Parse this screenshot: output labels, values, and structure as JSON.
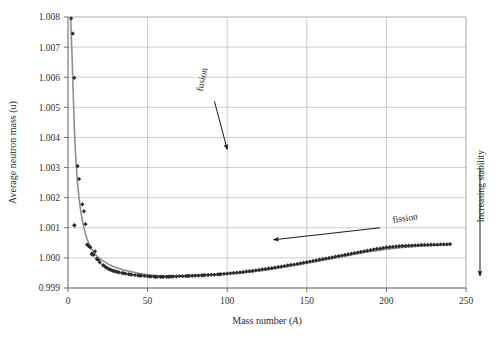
{
  "chart_data": {
    "type": "scatter",
    "title": "",
    "xlabel": "Mass number (A)",
    "xlabel_plain": "Mass number (",
    "xlabel_italic": "A",
    "xlabel_tail": ")",
    "ylabel": "Average neutron mass (u)",
    "xlim": [
      0,
      250
    ],
    "ylim": [
      0.999,
      1.008
    ],
    "xticks": [
      0,
      50,
      100,
      150,
      200,
      250
    ],
    "yticks": [
      0.999,
      1.0,
      1.001,
      1.002,
      1.003,
      1.004,
      1.005,
      1.006,
      1.007,
      1.008
    ],
    "xtick_labels": [
      "0",
      "50",
      "100",
      "150",
      "200",
      "250"
    ],
    "ytick_labels": [
      "0.999",
      "1.000",
      "1.001",
      "1.002",
      "1.003",
      "1.004",
      "1.005",
      "1.006",
      "1.007",
      "1.008"
    ],
    "grid": true,
    "grid_color": "#b9b9b9",
    "legend": "none",
    "marker": "diamond",
    "marker_color": "#2a2a2a",
    "line_color": "#8e8e8e",
    "series": [
      {
        "name": "Average neutron mass per nucleon",
        "points": [
          [
            2,
            1.00795
          ],
          [
            3,
            1.00745
          ],
          [
            4,
            1.00598
          ],
          [
            6,
            1.00305
          ],
          [
            7,
            1.00262
          ],
          [
            9,
            1.00178
          ],
          [
            10,
            1.00155
          ],
          [
            11,
            1.00112
          ],
          [
            12,
            1.00044
          ],
          [
            13,
            1.00039
          ],
          [
            14,
            1.00035
          ],
          [
            15,
            1.00014
          ],
          [
            16,
            1.0001
          ],
          [
            17,
            1.00022
          ],
          [
            18,
            0.99997
          ],
          [
            19,
            0.99993
          ],
          [
            20,
            0.99985
          ],
          [
            22,
            0.99976
          ],
          [
            23,
            0.99972
          ],
          [
            24,
            0.99968
          ],
          [
            25,
            0.99965
          ],
          [
            26,
            0.99962
          ],
          [
            27,
            0.9996
          ],
          [
            28,
            0.99958
          ],
          [
            29,
            0.99956
          ],
          [
            30,
            0.99955
          ],
          [
            31,
            0.99953
          ],
          [
            32,
            0.99952
          ],
          [
            34,
            0.9995
          ],
          [
            35,
            0.99949
          ],
          [
            36,
            0.99948
          ],
          [
            38,
            0.99946
          ],
          [
            39,
            0.99945
          ],
          [
            40,
            0.99944
          ],
          [
            42,
            0.99943
          ],
          [
            44,
            0.99942
          ],
          [
            45,
            0.99941
          ],
          [
            46,
            0.99941
          ],
          [
            48,
            0.9994
          ],
          [
            50,
            0.99939
          ],
          [
            51,
            0.99939
          ],
          [
            52,
            0.99938
          ],
          [
            54,
            0.99938
          ],
          [
            55,
            0.99937
          ],
          [
            56,
            0.99937
          ],
          [
            58,
            0.99937
          ],
          [
            59,
            0.99937
          ],
          [
            60,
            0.99937
          ],
          [
            62,
            0.99937
          ],
          [
            63,
            0.99937
          ],
          [
            64,
            0.99938
          ],
          [
            65,
            0.99938
          ],
          [
            66,
            0.99938
          ],
          [
            68,
            0.99938
          ],
          [
            70,
            0.99939
          ],
          [
            72,
            0.99939
          ],
          [
            74,
            0.99939
          ],
          [
            75,
            0.9994
          ],
          [
            76,
            0.9994
          ],
          [
            78,
            0.9994
          ],
          [
            80,
            0.99941
          ],
          [
            82,
            0.99941
          ],
          [
            84,
            0.99942
          ],
          [
            85,
            0.99942
          ],
          [
            86,
            0.99943
          ],
          [
            88,
            0.99943
          ],
          [
            90,
            0.99944
          ],
          [
            92,
            0.99944
          ],
          [
            94,
            0.99945
          ],
          [
            95,
            0.99945
          ],
          [
            96,
            0.99946
          ],
          [
            98,
            0.99947
          ],
          [
            100,
            0.99948
          ],
          [
            102,
            0.99949
          ],
          [
            104,
            0.9995
          ],
          [
            106,
            0.99951
          ],
          [
            108,
            0.99952
          ],
          [
            110,
            0.99953
          ],
          [
            112,
            0.99955
          ],
          [
            114,
            0.99956
          ],
          [
            116,
            0.99957
          ],
          [
            118,
            0.99959
          ],
          [
            120,
            0.9996
          ],
          [
            122,
            0.99962
          ],
          [
            124,
            0.99963
          ],
          [
            126,
            0.99965
          ],
          [
            128,
            0.99966
          ],
          [
            130,
            0.99968
          ],
          [
            132,
            0.9997
          ],
          [
            134,
            0.99971
          ],
          [
            136,
            0.99973
          ],
          [
            138,
            0.99975
          ],
          [
            140,
            0.99977
          ],
          [
            142,
            0.99978
          ],
          [
            144,
            0.9998
          ],
          [
            146,
            0.99982
          ],
          [
            148,
            0.99984
          ],
          [
            150,
            0.99986
          ],
          [
            152,
            0.99988
          ],
          [
            154,
            0.9999
          ],
          [
            156,
            0.99992
          ],
          [
            158,
            0.99994
          ],
          [
            160,
            0.99996
          ],
          [
            162,
            0.99998
          ],
          [
            164,
            1.0
          ],
          [
            166,
            1.00002
          ],
          [
            168,
            1.00004
          ],
          [
            170,
            1.00006
          ],
          [
            172,
            1.00008
          ],
          [
            174,
            1.0001
          ],
          [
            176,
            1.00012
          ],
          [
            178,
            1.00014
          ],
          [
            180,
            1.00016
          ],
          [
            182,
            1.00018
          ],
          [
            184,
            1.0002
          ],
          [
            186,
            1.00022
          ],
          [
            188,
            1.00024
          ],
          [
            190,
            1.00026
          ],
          [
            192,
            1.00028
          ],
          [
            194,
            1.0003
          ],
          [
            196,
            1.00031
          ],
          [
            198,
            1.00033
          ],
          [
            200,
            1.00035
          ],
          [
            202,
            1.00036
          ],
          [
            204,
            1.00037
          ],
          [
            206,
            1.00038
          ],
          [
            208,
            1.00039
          ],
          [
            210,
            1.0004
          ],
          [
            212,
            1.0004
          ],
          [
            214,
            1.00041
          ],
          [
            216,
            1.00041
          ],
          [
            218,
            1.00042
          ],
          [
            220,
            1.00042
          ],
          [
            222,
            1.00043
          ],
          [
            224,
            1.00043
          ],
          [
            226,
            1.00043
          ],
          [
            228,
            1.00044
          ],
          [
            230,
            1.00044
          ],
          [
            232,
            1.00044
          ],
          [
            234,
            1.00045
          ],
          [
            236,
            1.00045
          ],
          [
            238,
            1.00045
          ],
          [
            240,
            1.00046
          ]
        ],
        "outliers": [
          [
            4,
            1.00108
          ],
          [
            15,
            1.00012
          ]
        ]
      }
    ],
    "trend_line": {
      "name": "smoothed trend",
      "points": [
        [
          1.6,
          1.008
        ],
        [
          2.5,
          1.0068
        ],
        [
          3.2,
          1.0056
        ],
        [
          4,
          1.0043
        ],
        [
          5,
          1.0032
        ],
        [
          6,
          1.0025
        ],
        [
          7,
          1.00195
        ],
        [
          8,
          1.00155
        ],
        [
          9,
          1.00125
        ],
        [
          10,
          1.001
        ],
        [
          11,
          1.0008
        ],
        [
          12,
          1.00063
        ],
        [
          13,
          1.00049
        ],
        [
          14,
          1.00038
        ],
        [
          15,
          1.00028
        ],
        [
          16,
          1.0002
        ],
        [
          18,
          1.00007
        ],
        [
          20,
          0.99998
        ],
        [
          22,
          0.9999
        ],
        [
          25,
          0.9998
        ],
        [
          28,
          0.99972
        ],
        [
          30,
          0.99968
        ],
        [
          35,
          0.9996
        ],
        [
          40,
          0.99954
        ],
        [
          45,
          0.99948
        ],
        [
          50,
          0.99944
        ],
        [
          55,
          0.99941
        ],
        [
          60,
          0.9994
        ],
        [
          65,
          0.9994
        ],
        [
          70,
          0.99941
        ],
        [
          75,
          0.99942
        ],
        [
          80,
          0.99943
        ],
        [
          85,
          0.99944
        ],
        [
          90,
          0.99945
        ],
        [
          95,
          0.99946
        ],
        [
          100,
          0.99947
        ],
        [
          110,
          0.99951
        ],
        [
          120,
          0.99957
        ],
        [
          130,
          0.99964
        ],
        [
          140,
          0.99973
        ],
        [
          150,
          0.99982
        ],
        [
          160,
          0.99992
        ],
        [
          170,
          1.00002
        ],
        [
          180,
          1.00012
        ],
        [
          190,
          1.00021
        ],
        [
          200,
          1.00029
        ],
        [
          210,
          1.00035
        ],
        [
          220,
          1.00039
        ],
        [
          230,
          1.00042
        ],
        [
          240,
          1.00044
        ]
      ]
    },
    "annotations": [
      {
        "id": "fusion",
        "text": "fusion",
        "label_x": 86,
        "label_y": 1.0059,
        "rotation": -78,
        "arrow_from": [
          92,
          1.0052
        ],
        "arrow_to": [
          100,
          1.0036
        ]
      },
      {
        "id": "fission",
        "text": "fission",
        "label_x": 212,
        "label_y": 1.00122,
        "rotation": -8,
        "arrow_from": [
          196,
          1.001
        ],
        "arrow_to": [
          129,
          1.0006
        ]
      },
      {
        "id": "increasing-stability",
        "text": "Increasing stability",
        "rotation": -90,
        "arrow_from_px": [
          480,
          168
        ],
        "arrow_to_px": [
          480,
          276
        ]
      }
    ]
  },
  "figure": {
    "background_color": "#ffffff",
    "axis_color": "#6f6f6f",
    "plot_left_px": 68,
    "plot_right_px": 466,
    "plot_top_px": 17,
    "plot_bottom_px": 288
  }
}
